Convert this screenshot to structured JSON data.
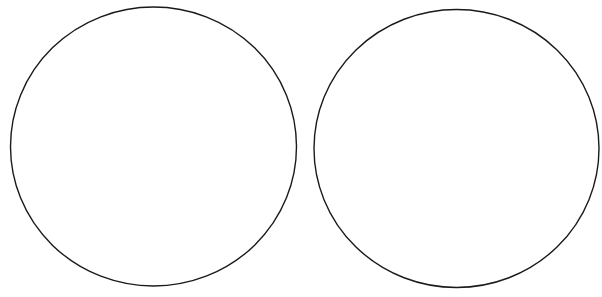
{
  "canvas": {
    "width": 602,
    "height": 297,
    "background": "#ffffff"
  },
  "shapes": [
    {
      "type": "ellipse",
      "name": "left-circle",
      "cx": 153.5,
      "cy": 146.5,
      "rx": 143,
      "ry": 139.5,
      "stroke": "#1a1a1a",
      "stroke_width": 1.4,
      "fill": "none"
    },
    {
      "type": "ellipse",
      "name": "right-circle",
      "cx": 456.5,
      "cy": 148.5,
      "rx": 142.5,
      "ry": 139,
      "stroke": "#1a1a1a",
      "stroke_width": 1.4,
      "fill": "none"
    }
  ]
}
